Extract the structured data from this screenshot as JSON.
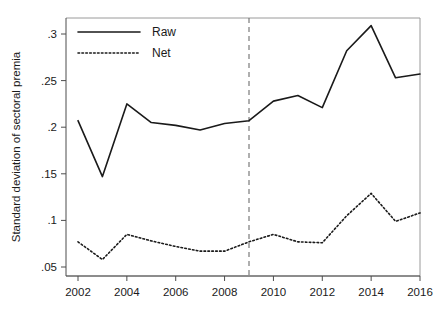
{
  "chart_data": {
    "type": "line",
    "title": "",
    "xlabel": "",
    "ylabel": "Standard deviation of sectoral premia",
    "x": [
      2002,
      2003,
      2004,
      2005,
      2006,
      2007,
      2008,
      2009,
      2010,
      2011,
      2012,
      2013,
      2014,
      2015,
      2016
    ],
    "xlim": [
      2001.5,
      2016.5
    ],
    "ylim": [
      0.04,
      0.32
    ],
    "xticks": [
      2002,
      2004,
      2006,
      2008,
      2010,
      2012,
      2014,
      2016
    ],
    "xtick_labels": [
      "2002",
      "2004",
      "2006",
      "2008",
      "2010",
      "2012",
      "2014",
      "2016"
    ],
    "yticks": [
      0.05,
      0.1,
      0.15,
      0.2,
      0.25,
      0.3
    ],
    "ytick_labels": [
      ".05",
      ".1",
      ".15",
      ".2",
      ".25",
      ".3"
    ],
    "grid": false,
    "legend_position": "top-left",
    "series": [
      {
        "name": "Raw",
        "style": "solid",
        "color": "#1a1a1a",
        "values": [
          0.207,
          0.147,
          0.225,
          0.205,
          0.202,
          0.197,
          0.204,
          0.207,
          0.228,
          0.234,
          0.221,
          0.282,
          0.309,
          0.253,
          0.257
        ]
      },
      {
        "name": "Net",
        "style": "dotted",
        "color": "#1a1a1a",
        "values": [
          0.077,
          0.058,
          0.085,
          0.078,
          0.072,
          0.067,
          0.067,
          0.077,
          0.085,
          0.077,
          0.076,
          0.105,
          0.129,
          0.099,
          0.108
        ]
      }
    ],
    "annotations": [
      {
        "name": "reference-line",
        "type": "vline",
        "x": 2009,
        "style": "dashed",
        "color": "#6e6e6e"
      }
    ]
  },
  "legend": {
    "entries": [
      {
        "label": "Raw",
        "style": "solid"
      },
      {
        "label": "Net",
        "style": "dotted"
      }
    ]
  }
}
